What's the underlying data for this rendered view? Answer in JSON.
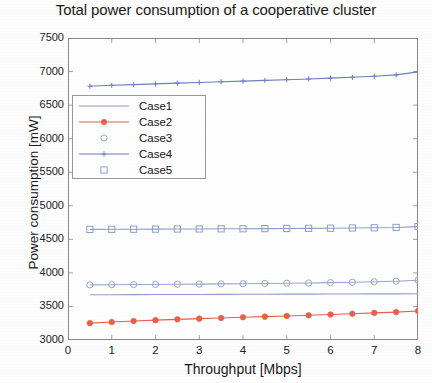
{
  "chart_data": {
    "type": "line",
    "title": "Total power consumption of a cooperative cluster",
    "xlabel": "Throughput [Mbps]",
    "ylabel": "Power consumption [mW]",
    "xlim": [
      0,
      8
    ],
    "ylim": [
      3000,
      7500
    ],
    "xticks": [
      0,
      1,
      2,
      3,
      4,
      5,
      6,
      7,
      8
    ],
    "yticks": [
      3000,
      3500,
      4000,
      4500,
      5000,
      5500,
      6000,
      6500,
      7000,
      7500
    ],
    "grid": false,
    "legend_position": "upper left",
    "x": [
      0.5,
      1.0,
      1.5,
      2.0,
      2.5,
      3.0,
      3.5,
      4.0,
      4.5,
      5.0,
      5.5,
      6.0,
      6.5,
      7.0,
      7.5,
      8.0
    ],
    "series": [
      {
        "name": "Case1",
        "color": "#8e9ec4",
        "marker": "none",
        "values": [
          3675,
          3675,
          3676,
          3677,
          3678,
          3679,
          3680,
          3681,
          3682,
          3683,
          3684,
          3685,
          3686,
          3687,
          3688,
          3690
        ]
      },
      {
        "name": "Case2",
        "color": "#e8604c",
        "marker": "filled-circle",
        "values": [
          3252,
          3268,
          3283,
          3296,
          3308,
          3318,
          3328,
          3338,
          3348,
          3358,
          3368,
          3380,
          3392,
          3404,
          3416,
          3432
        ]
      },
      {
        "name": "Case3",
        "color": "#9aa6cc",
        "marker": "open-circle",
        "values": [
          3822,
          3824,
          3826,
          3828,
          3830,
          3833,
          3836,
          3839,
          3842,
          3846,
          3850,
          3855,
          3861,
          3868,
          3876,
          3890
        ]
      },
      {
        "name": "Case4",
        "color": "#6f7fc0",
        "marker": "plus",
        "values": [
          6782,
          6795,
          6806,
          6817,
          6828,
          6838,
          6848,
          6858,
          6868,
          6879,
          6890,
          6902,
          6915,
          6930,
          6950,
          6995
        ]
      },
      {
        "name": "Case5",
        "color": "#8e9ec4",
        "marker": "open-square",
        "values": [
          4648,
          4650,
          4651,
          4652,
          4654,
          4655,
          4657,
          4658,
          4660,
          4662,
          4664,
          4666,
          4669,
          4672,
          4677,
          4690
        ]
      }
    ],
    "legend": [
      "Case1",
      "Case2",
      "Case3",
      "Case4",
      "Case5"
    ]
  }
}
